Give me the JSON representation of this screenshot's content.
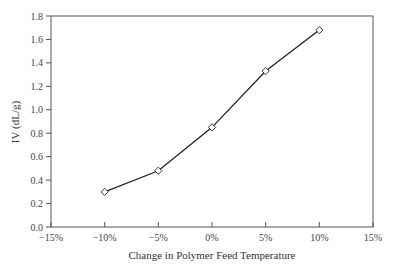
{
  "chart_data": {
    "type": "line",
    "title": "",
    "xlabel": "Change in Polymer Feed Temperature",
    "ylabel": "IV (dL/g)",
    "x_ticks": [
      "−15%",
      "−10%",
      "−5%",
      "0%",
      "5%",
      "10%",
      "15%"
    ],
    "x_tick_values": [
      -15,
      -10,
      -5,
      0,
      5,
      10,
      15
    ],
    "y_ticks": [
      "0.0",
      "0.2",
      "0.4",
      "0.6",
      "0.8",
      "1.0",
      "1.2",
      "1.4",
      "1.6",
      "1.8"
    ],
    "y_tick_values": [
      0,
      0.2,
      0.4,
      0.6,
      0.8,
      1.0,
      1.2,
      1.4,
      1.6,
      1.8
    ],
    "xlim": [
      -15,
      15
    ],
    "ylim": [
      0,
      1.8
    ],
    "grid": false,
    "legend": null,
    "marker": "open-diamond",
    "series": [
      {
        "name": "IV",
        "x": [
          -10,
          -5,
          0,
          5,
          10
        ],
        "values": [
          0.3,
          0.48,
          0.85,
          1.33,
          1.68
        ]
      }
    ],
    "colors": {
      "line": "#222222",
      "axis": "#555555",
      "marker_fill": "#ffffff"
    }
  }
}
